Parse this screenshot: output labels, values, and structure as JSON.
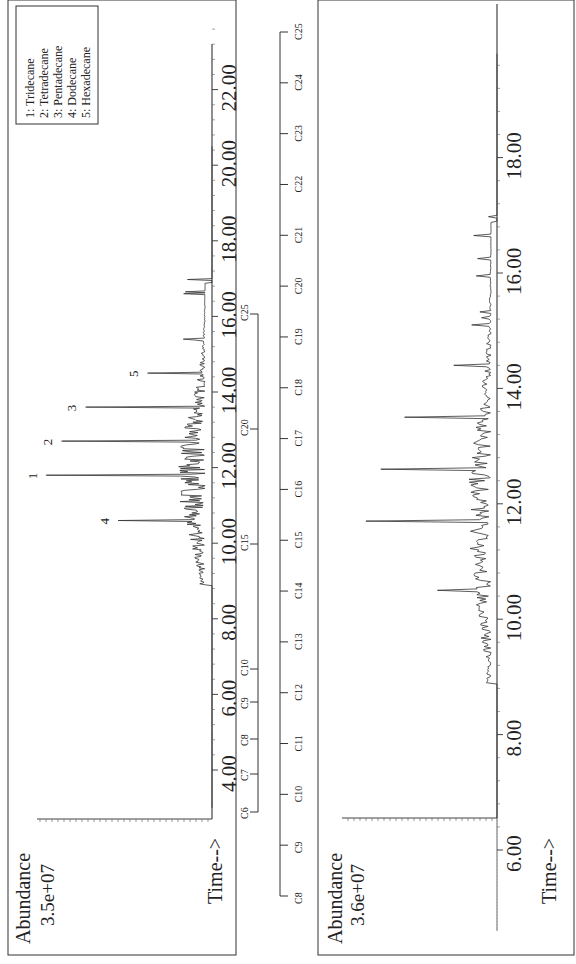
{
  "chart_data": [
    {
      "type": "line",
      "title": "",
      "xlabel": "Time-->",
      "ylabel": "Abundance",
      "y_max_label": "3.5e+07",
      "x_ticks": [
        "4.00",
        "6.00",
        "8.00",
        "10.00",
        "12.00",
        "14.00",
        "16.00",
        "18.00",
        "20.00",
        "22.00"
      ],
      "xlim": [
        3.0,
        23.0
      ],
      "legend": [
        "1: Tridecane",
        "2: Tetradecane",
        "3: Pentadecane",
        "4: Dodecane",
        "5: Hexadecane"
      ],
      "peak_labels": [
        {
          "label": "4",
          "time": 10.6,
          "rel_height": 0.54
        },
        {
          "label": "1",
          "time": 11.8,
          "rel_height": 0.96
        },
        {
          "label": "2",
          "time": 12.7,
          "rel_height": 0.87
        },
        {
          "label": "3",
          "time": 13.6,
          "rel_height": 0.73
        },
        {
          "label": "5",
          "time": 14.5,
          "rel_height": 0.37
        }
      ],
      "carbon_scale": [
        "C6",
        "C7",
        "C8",
        "C9",
        "C10",
        "C15",
        "C20",
        "C25"
      ]
    },
    {
      "type": "line",
      "title": "",
      "xlabel": "Time-->",
      "ylabel": "Abundance",
      "y_max_label": "3.6e+07",
      "x_ticks": [
        "6.00",
        "8.00",
        "10.00",
        "12.00",
        "14.00",
        "16.00",
        "18.00"
      ],
      "xlim": [
        4.5,
        20.0
      ],
      "carbon_scale": [
        "C8",
        "C9",
        "C10",
        "C11",
        "C12",
        "C13",
        "C14",
        "C15",
        "C16",
        "C17",
        "C18",
        "C19",
        "C20",
        "C21",
        "C22",
        "C23",
        "C24",
        "C25"
      ],
      "major_peaks": [
        {
          "time": 10.5,
          "rel_height": 0.4
        },
        {
          "time": 11.7,
          "rel_height": 0.88
        },
        {
          "time": 12.6,
          "rel_height": 0.78
        },
        {
          "time": 13.5,
          "rel_height": 0.62
        },
        {
          "time": 14.4,
          "rel_height": 0.29
        }
      ]
    }
  ],
  "upper": {
    "abundance_label": "Abundance",
    "y_max": "3.5e+07",
    "time_label": "Time-->",
    "ticks": [
      "4.00",
      "6.00",
      "8.00",
      "10.00",
      "12.00",
      "14.00",
      "16.00",
      "18.00",
      "20.00",
      "22.00"
    ],
    "legend": [
      "1: Tridecane",
      "2: Tetradecane",
      "3: Pentadecane",
      "4: Dodecane",
      "5: Hexadecane"
    ],
    "peaks": [
      "4",
      "1",
      "2",
      "3",
      "5"
    ],
    "carbons": [
      "C6",
      "C7",
      "C8",
      "C9",
      "C10",
      "C15",
      "C20",
      "C25"
    ]
  },
  "middle": {
    "carbons": [
      "C8",
      "C9",
      "C10",
      "C11",
      "C12",
      "C13",
      "C14",
      "C15",
      "C16",
      "C17",
      "C18",
      "C19",
      "C20",
      "C21",
      "C22",
      "C23",
      "C24",
      "C25"
    ]
  },
  "lower": {
    "abundance_label": "Abundance",
    "y_max": "3.6e+07",
    "time_label": "Time-->",
    "ticks": [
      "6.00",
      "8.00",
      "10.00",
      "12.00",
      "14.00",
      "16.00",
      "18.00"
    ]
  }
}
